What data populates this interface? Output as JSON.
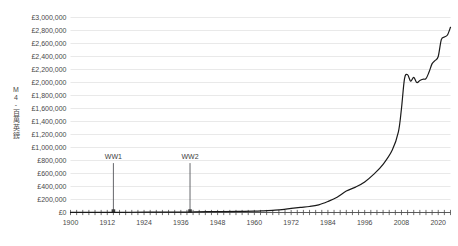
{
  "chart_data": {
    "type": "line",
    "title": "",
    "xlabel": "",
    "ylabel": "M4 - 百萬英鎊",
    "ylabel_chars": [
      "M",
      "4",
      "-",
      "百",
      "萬",
      "英",
      "鎊"
    ],
    "xlim": [
      1900,
      2024
    ],
    "ylim": [
      0,
      3000000
    ],
    "grid": true,
    "legend": "none",
    "line_color": "#1a1a1a",
    "gridline_color": "#e3e3e3",
    "axis_color": "#4a4a4a",
    "y_ticks": [
      0,
      200000,
      400000,
      600000,
      800000,
      1000000,
      1200000,
      1400000,
      1600000,
      1800000,
      2000000,
      2200000,
      2400000,
      2600000,
      2800000,
      3000000
    ],
    "y_tick_labels": [
      "£0",
      "£200,000",
      "£400,000",
      "£600,000",
      "£800,000",
      "£1,000,000",
      "£1,200,000",
      "£1,400,000",
      "£1,600,000",
      "£1,800,000",
      "£2,000,000",
      "£2,200,000",
      "£2,400,000",
      "£2,600,000",
      "£2,800,000",
      "£3,000,000"
    ],
    "x_ticks": [
      1900,
      1912,
      1924,
      1936,
      1948,
      1960,
      1972,
      1984,
      1996,
      2008,
      2020
    ],
    "x_tick_labels": [
      "1900",
      "1912",
      "1924",
      "1936",
      "1948",
      "1960",
      "1972",
      "1984",
      "1996",
      "2008",
      "2020"
    ],
    "x_minor_tick_step": 2,
    "annotations": [
      {
        "label": "WW1",
        "x": 1914,
        "y_top": 760000,
        "y_bottom": 0
      },
      {
        "label": "WW2",
        "x": 1939,
        "y_top": 760000,
        "y_bottom": 0
      }
    ],
    "x": [
      1900,
      1905,
      1910,
      1915,
      1920,
      1925,
      1930,
      1935,
      1940,
      1945,
      1950,
      1955,
      1960,
      1963,
      1966,
      1969,
      1972,
      1975,
      1978,
      1981,
      1984,
      1987,
      1990,
      1993,
      1996,
      1999,
      2002,
      2005,
      2007,
      2008,
      2009,
      2010,
      2011,
      2012,
      2013,
      2014,
      2015,
      2016,
      2017,
      2018,
      2019,
      2020,
      2021,
      2022,
      2023,
      2024
    ],
    "values": [
      1000,
      1200,
      1500,
      2000,
      4000,
      5000,
      5500,
      6000,
      8000,
      12000,
      14000,
      16000,
      20000,
      26000,
      34000,
      44000,
      62000,
      78000,
      92000,
      118000,
      170000,
      235000,
      330000,
      390000,
      470000,
      590000,
      740000,
      960000,
      1240000,
      1600000,
      2060000,
      2120000,
      2020000,
      2080000,
      2000000,
      2030000,
      2050000,
      2060000,
      2160000,
      2290000,
      2340000,
      2400000,
      2660000,
      2700000,
      2730000,
      2850000
    ]
  }
}
